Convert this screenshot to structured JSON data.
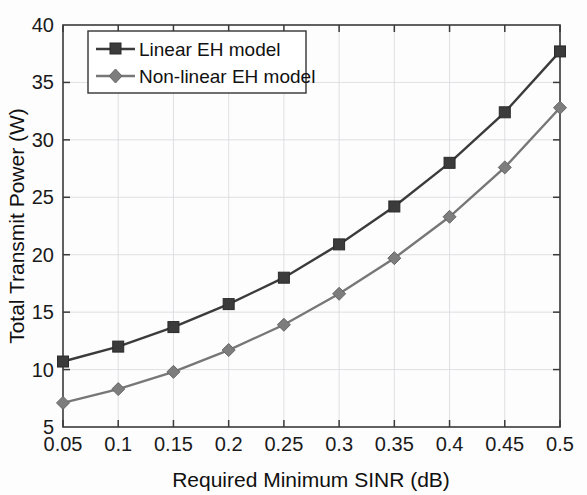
{
  "chart_data": {
    "type": "line",
    "title": "",
    "xlabel": "Required Minimum SINR (dB)",
    "ylabel": "Total Transmit Power (W)",
    "x": [
      0.05,
      0.1,
      0.15,
      0.2,
      0.25,
      0.3,
      0.35,
      0.4,
      0.45,
      0.5
    ],
    "xtick_labels": [
      "0.05",
      "0.1",
      "0.15",
      "0.2",
      "0.25",
      "0.3",
      "0.35",
      "0.4",
      "0.45",
      "0.5"
    ],
    "ytick_labels": [
      "5",
      "10",
      "15",
      "20",
      "25",
      "30",
      "35",
      "40"
    ],
    "yticks": [
      5,
      10,
      15,
      20,
      25,
      30,
      35,
      40
    ],
    "xlim": [
      0.05,
      0.5
    ],
    "ylim": [
      5,
      40
    ],
    "grid": true,
    "legend_position": "upper left",
    "series": [
      {
        "name": "Linear EH model",
        "marker": "square",
        "color": "#3b3b3b",
        "values": [
          10.7,
          12.0,
          13.7,
          15.7,
          18.0,
          20.9,
          24.2,
          28.0,
          32.4,
          37.7
        ]
      },
      {
        "name": "Non-linear EH model",
        "marker": "diamond",
        "color": "#7d7d7d",
        "values": [
          7.1,
          8.3,
          9.8,
          11.7,
          13.9,
          16.6,
          19.7,
          23.3,
          27.6,
          32.8
        ]
      }
    ]
  }
}
